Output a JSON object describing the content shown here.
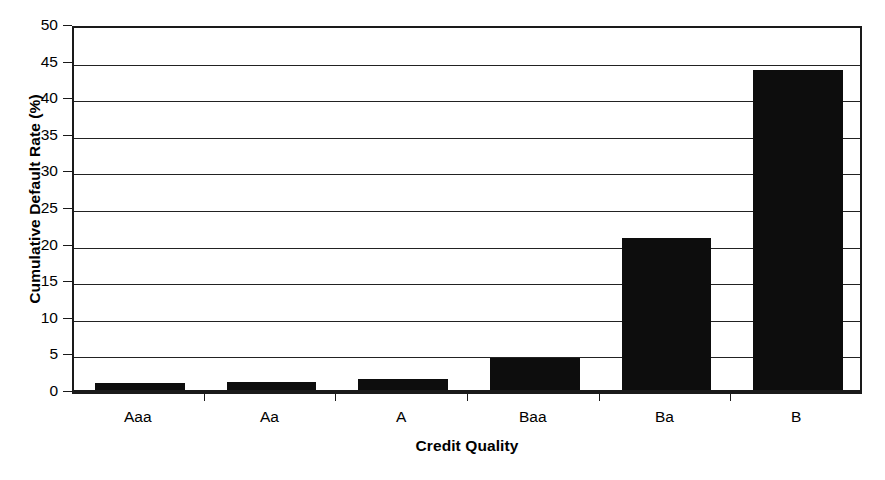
{
  "chart_data": {
    "type": "bar",
    "title": "",
    "xlabel": "Credit Quality",
    "ylabel": "Cumulative Default Rate (%)",
    "categories": [
      "Aaa",
      "Aa",
      "A",
      "Baa",
      "Ba",
      "B"
    ],
    "values": [
      0.9,
      1.1,
      1.5,
      4.4,
      20.7,
      43.7
    ],
    "ylim": [
      0,
      50
    ],
    "ytick_step": 5,
    "yticks": [
      0,
      5,
      10,
      15,
      20,
      25,
      30,
      35,
      40,
      45,
      50
    ],
    "ytick_labels": [
      "0",
      "5",
      "10",
      "15",
      "20",
      "25",
      "30",
      "35",
      "40",
      "45",
      "50"
    ],
    "grid": true,
    "grid_axis": "y",
    "legend": false,
    "legend_position": "none",
    "bar_color": "#0d0d0d",
    "axis_color": "#1a1a1a",
    "background_color": "#ffffff",
    "bar_width_ratio": 0.68
  }
}
